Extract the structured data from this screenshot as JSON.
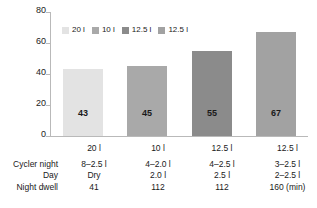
{
  "chart_data": {
    "type": "bar",
    "title": "",
    "xlabel": "",
    "ylabel": "",
    "ylim": [
      0,
      80
    ],
    "yticks": [
      0,
      20,
      40,
      60,
      80
    ],
    "ytick_labels": [
      "0",
      "20",
      "40",
      "60",
      "80"
    ],
    "grid": false,
    "legend_position": "top-left-inside",
    "categories": [
      "20 l",
      "10 l",
      "12.5 l",
      "12.5 l"
    ],
    "values": [
      43,
      45,
      55,
      67
    ],
    "value_labels": [
      "43",
      "45",
      "55",
      "67"
    ],
    "bar_colors": [
      "#e3e3e3",
      "#a9a9a9",
      "#8b8b8b",
      "#a2a2a2"
    ],
    "legend": [
      {
        "label": "20 l",
        "color": "#e3e3e3"
      },
      {
        "label": "10 l",
        "color": "#a9a9a9"
      },
      {
        "label": "12.5 l",
        "color": "#8b8b8b"
      },
      {
        "label": "12.5 l",
        "color": "#a2a2a2"
      }
    ],
    "annotation_table": {
      "row_labels": [
        "Cycler night",
        "Day",
        "Night dwell"
      ],
      "rows": [
        [
          "8–2.5 l",
          "4–2.0 l",
          "4–2.5 l",
          "3–2.5 l"
        ],
        [
          "Dry",
          "2.0 l",
          "2.5 l",
          "2–2.5 l"
        ],
        [
          "41",
          "112",
          "112",
          "160 (min)"
        ]
      ]
    }
  }
}
